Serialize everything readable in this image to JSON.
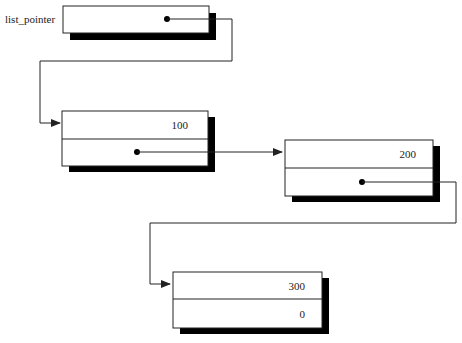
{
  "diagram": {
    "head_label": "list_pointer",
    "nodes": [
      {
        "data": "100",
        "next": ""
      },
      {
        "data": "200",
        "next": ""
      },
      {
        "data": "300",
        "next": "0"
      }
    ],
    "colors": {
      "line": "#222222",
      "shadow": "#000000",
      "box": "#ffffff"
    }
  }
}
